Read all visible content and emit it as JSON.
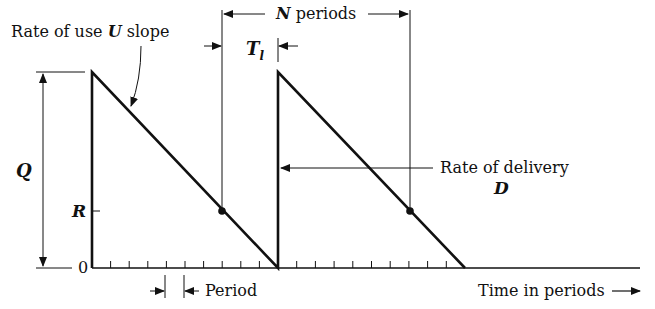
{
  "diagram": {
    "type": "inventory sawtooth diagram",
    "labels": {
      "rate_of_use": "Rate of use",
      "rate_of_use_symbol": "U",
      "rate_of_use_suffix": "slope",
      "n_periods_symbol": "N",
      "n_periods_text": "periods",
      "lead_time_symbol": "T",
      "lead_time_subscript": "l",
      "q_label": "Q",
      "r_label": "R",
      "zero_label": "0",
      "rate_of_delivery": "Rate of delivery",
      "rate_of_delivery_symbol": "D",
      "period_label": "Period",
      "time_axis_label": "Time in periods",
      "time_axis_arrow": "—▸"
    },
    "geometry": {
      "baseline_y": 268,
      "top_y": 72,
      "reorder_level_y": 211,
      "cycle1_start_x": 92,
      "cycle1_end_x": 278,
      "cycle2_end_x": 465,
      "axis_end_x": 640,
      "tick_spacing": 18.6,
      "periods_per_cycle": 10
    }
  }
}
